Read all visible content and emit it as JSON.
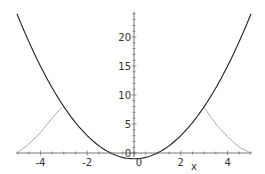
{
  "chart_data": {
    "type": "line",
    "title": "",
    "xlabel": "x",
    "ylabel": "",
    "xlim": [
      -5,
      5
    ],
    "ylim": [
      -1,
      24
    ],
    "grid": false,
    "legend": null,
    "x_ticks": [
      -4,
      -2,
      0,
      2,
      4
    ],
    "x_tick_labels": [
      "-4",
      "-2",
      "0",
      "2",
      "4"
    ],
    "y_ticks": [
      0,
      5,
      10,
      15,
      20
    ],
    "y_tick_labels": [
      "0",
      "5",
      "10",
      "15",
      "20"
    ],
    "series": [
      {
        "name": "parabola",
        "color": "#222222",
        "style": "solid",
        "x": [
          -5,
          -4,
          -3,
          -2,
          -1,
          0,
          1,
          2,
          3,
          4,
          5
        ],
        "y": [
          24,
          15,
          8,
          3,
          0,
          -1,
          0,
          3,
          8,
          15,
          24
        ]
      },
      {
        "name": "gray-curve",
        "color": "#999999",
        "style": "solid-thin",
        "segments": [
          {
            "x": [
              -5,
              -4.5,
              -4,
              -3.5,
              -3.1
            ],
            "y": [
              0,
              1.5,
              3.5,
              6,
              7.8
            ]
          },
          {
            "x": [
              3,
              3.5,
              4,
              4.5,
              5
            ],
            "y": [
              7.8,
              5,
              2.8,
              1,
              0
            ]
          }
        ]
      }
    ]
  }
}
